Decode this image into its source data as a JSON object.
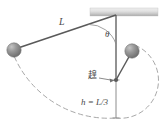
{
  "figure": {
    "labels": {
      "length": "L",
      "angle": "θ",
      "peg": "䞹",
      "height": "h = L/3"
    },
    "colors": {
      "ball": "#8a8a8a",
      "ball_dark": "#6b6b6b",
      "ball_light": "#bdbdbd",
      "line": "#5a5a5a",
      "dashed": "#a8a8a8",
      "ceiling_light": "#e8e8e8",
      "ceiling_dark": "#a9a9a9",
      "text": "#4a4a4a"
    },
    "geometry": {
      "pivot": {
        "x": 116,
        "y": 15
      },
      "ceiling": {
        "x": 90,
        "y": 8,
        "width": 68,
        "height": 8
      },
      "left_ball": {
        "x": 14,
        "y": 50,
        "r": 7
      },
      "right_ball": {
        "x": 132,
        "y": 51,
        "r": 7
      },
      "peg": {
        "x": 116,
        "y": 80,
        "r": 1.8
      },
      "bottom": {
        "x": 116,
        "y": 118
      },
      "string_length": 103,
      "peg_string_length": 38
    }
  }
}
